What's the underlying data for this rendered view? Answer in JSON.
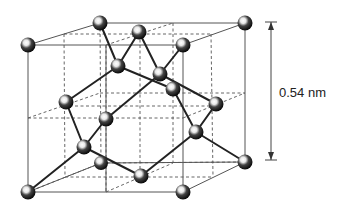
{
  "diagram": {
    "dimension_label": "0.54 nm",
    "colors": {
      "atom_dark": "#111111",
      "atom_highlight": "#ffffff",
      "edge": "#555555",
      "bond": "#222222",
      "text": "#222222"
    },
    "atoms": {
      "corners": [
        {
          "id": "front-top-left",
          "x": 28,
          "y": 45
        },
        {
          "id": "back-top-left",
          "x": 100,
          "y": 23
        },
        {
          "id": "back-top-right",
          "x": 245,
          "y": 23
        },
        {
          "id": "front-top-right",
          "x": 183,
          "y": 45
        },
        {
          "id": "front-bottom-left",
          "x": 28,
          "y": 192
        },
        {
          "id": "front-bottom-right",
          "x": 183,
          "y": 192
        },
        {
          "id": "back-bottom-right",
          "x": 245,
          "y": 162
        },
        {
          "id": "back-bottom-left",
          "x": 101,
          "y": 163
        }
      ],
      "face_centers": [
        {
          "id": "top",
          "x": 139,
          "y": 32
        },
        {
          "id": "bottom",
          "x": 141,
          "y": 176
        },
        {
          "id": "left",
          "x": 66,
          "y": 102
        },
        {
          "id": "right",
          "x": 216,
          "y": 104
        },
        {
          "id": "front",
          "x": 106,
          "y": 119
        },
        {
          "id": "back",
          "x": 173,
          "y": 89
        }
      ],
      "tetrahedral": [
        {
          "id": "t1",
          "x": 118,
          "y": 66
        },
        {
          "id": "t2",
          "x": 160,
          "y": 74
        },
        {
          "id": "t3",
          "x": 84,
          "y": 147
        },
        {
          "id": "t4",
          "x": 196,
          "y": 132
        }
      ]
    }
  }
}
